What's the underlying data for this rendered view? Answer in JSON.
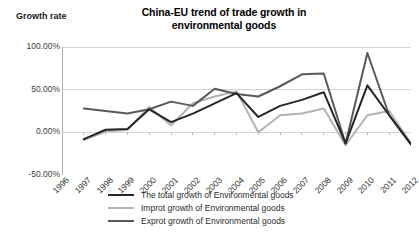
{
  "chart_data": {
    "type": "line",
    "title": "China-EU trend of trade growth in environmental goods",
    "title_line1": "China-EU trend of trade growth in",
    "title_line2": "environmental goods",
    "ylabel": "Growth rate",
    "xlabel": "",
    "grid": true,
    "legend_position": "bottom",
    "ylim": [
      -50,
      100
    ],
    "yticks": [
      100,
      50,
      0,
      -50
    ],
    "ytick_labels": [
      "100.00%",
      "50.00%",
      "0.00%",
      "-50.00%"
    ],
    "categories": [
      "1996",
      "1997",
      "1998",
      "1999",
      "2000",
      "2001",
      "2002",
      "2003",
      "2004",
      "2005",
      "2006",
      "2007",
      "2008",
      "2009",
      "2010",
      "2011",
      "2012"
    ],
    "series": [
      {
        "name": "The total growth of Environmental goods",
        "color": "#262626",
        "width": 2.0,
        "values": [
          null,
          -8,
          3,
          4,
          27,
          12,
          22,
          34,
          46,
          18,
          31,
          38,
          47,
          -13,
          55,
          20,
          -14
        ]
      },
      {
        "name": "Improt growth of Environmental goods",
        "color": "#b3b3b3",
        "width": 2.0,
        "values": [
          null,
          -9,
          1,
          3,
          30,
          8,
          34,
          42,
          48,
          0,
          20,
          22,
          28,
          -15,
          20,
          25,
          -13
        ]
      },
      {
        "name": "Exprot growth of Environmental goods",
        "color": "#595959",
        "width": 2.0,
        "values": [
          null,
          28,
          25,
          22,
          27,
          36,
          31,
          51,
          45,
          42,
          54,
          68,
          69,
          -13,
          93,
          20,
          -14
        ]
      }
    ]
  }
}
